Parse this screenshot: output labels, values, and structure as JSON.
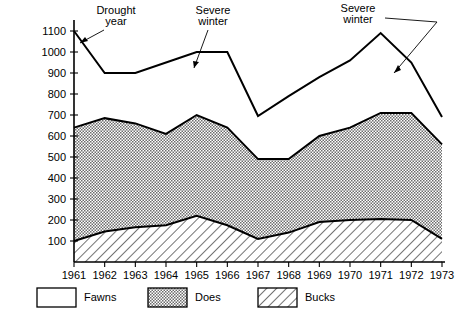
{
  "chart_data": {
    "type": "area",
    "title": "",
    "subtitle": "",
    "xlabel": "",
    "ylabel": "",
    "stacked": true,
    "grid": false,
    "legend_position": "bottom",
    "xlim": [
      1961,
      1973
    ],
    "ylim": [
      0,
      1100
    ],
    "categories": [
      1961,
      1962,
      1963,
      1964,
      1965,
      1966,
      1967,
      1968,
      1969,
      1970,
      1971,
      1972,
      1973
    ],
    "x_tick_labels": [
      "1961",
      "1962",
      "1963",
      "1964",
      "1965",
      "1966",
      "1967",
      "1968",
      "1969",
      "1970",
      "1971",
      "1972",
      "1973"
    ],
    "y_tick_values": [
      100,
      200,
      300,
      400,
      500,
      600,
      700,
      800,
      900,
      1000,
      1100
    ],
    "y_tick_labels": [
      "100",
      "200",
      "300",
      "400",
      "500",
      "600",
      "700",
      "800",
      "900",
      "1000",
      "1100"
    ],
    "series": [
      {
        "name": "Bucks",
        "pattern": "diagonal-hatch",
        "values": [
          100,
          145,
          165,
          175,
          220,
          175,
          110,
          140,
          190,
          200,
          205,
          200,
          110
        ]
      },
      {
        "name": "Does",
        "pattern": "dotted-fill",
        "values": [
          540,
          540,
          495,
          435,
          480,
          465,
          380,
          350,
          410,
          440,
          505,
          510,
          450
        ]
      },
      {
        "name": "Fawns",
        "pattern": "white",
        "values": [
          460,
          215,
          240,
          340,
          300,
          360,
          200,
          270,
          280,
          320,
          380,
          240,
          130
        ]
      }
    ],
    "cumulative_boundaries": {
      "bucks_top": [
        100,
        145,
        165,
        175,
        220,
        175,
        110,
        140,
        190,
        200,
        205,
        200,
        110
      ],
      "does_top": [
        640,
        685,
        660,
        610,
        700,
        640,
        490,
        490,
        600,
        640,
        710,
        710,
        560
      ],
      "total_top": [
        1100,
        900,
        900,
        950,
        1000,
        1000,
        695,
        790,
        880,
        960,
        1090,
        950,
        690
      ]
    },
    "annotations": [
      {
        "text_line1": "Drought",
        "text_line2": "year",
        "points_at_year": 1962
      },
      {
        "text_line1": "Severe",
        "text_line2": "winter",
        "points_at_year": 1966
      },
      {
        "text_line1": "Severe",
        "text_line2": "winter",
        "points_at_year": 1972
      }
    ],
    "legend": [
      {
        "label": "Fawns",
        "pattern": "white"
      },
      {
        "label": "Does",
        "pattern": "dotted-fill"
      },
      {
        "label": "Bucks",
        "pattern": "diagonal-hatch"
      }
    ]
  },
  "colors": {
    "ink": "#000000",
    "background": "#ffffff",
    "does_fill": "#b8b8b8",
    "bucks_fill": "#ffffff"
  }
}
